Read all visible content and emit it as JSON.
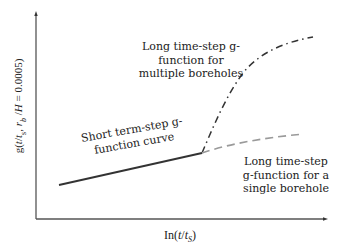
{
  "diagram": {
    "type": "conceptual line diagram",
    "axes": {
      "y_label": "g(t/t_s, r_b/H = 0.0005)",
      "x_label": "ln(t/t_s)",
      "arrows": true
    },
    "curves": [
      {
        "name": "short-term",
        "style": "solid",
        "color": "#333333"
      },
      {
        "name": "long-multiple",
        "style": "dash-dot",
        "color": "#333333"
      },
      {
        "name": "long-single",
        "style": "dashed",
        "color": "#9a9a9a"
      }
    ],
    "annotations": {
      "multiple": [
        "Long time-step g-",
        "function for",
        "multiple boreholes"
      ],
      "short": [
        "Short term-step g-",
        "function curve"
      ],
      "single": [
        "Long time-step",
        "g-function for a",
        "single borehole"
      ]
    }
  },
  "text": {
    "y_label_pre": "g(",
    "y_label_t": "t",
    "y_label_slash1": "/",
    "y_label_ts": "t",
    "y_label_s": "s",
    "y_label_comma": ", ",
    "y_label_r": "r",
    "y_label_b": "b",
    "y_label_slash2": " /",
    "y_label_H": "H",
    "y_label_tail": " = 0.0005)",
    "x_label_pre": "In(",
    "x_label_t": "t",
    "x_label_slash": "/",
    "x_label_ts": "t",
    "x_label_s": "S",
    "x_label_close": ")",
    "multiple_1": "Long time-step g-",
    "multiple_2": "function for",
    "multiple_3": "multiple boreholes",
    "short_1": "Short term-step g-",
    "short_2": "function curve",
    "single_1": "Long time-step",
    "single_2": "g-function for a",
    "single_3": "single borehole"
  }
}
